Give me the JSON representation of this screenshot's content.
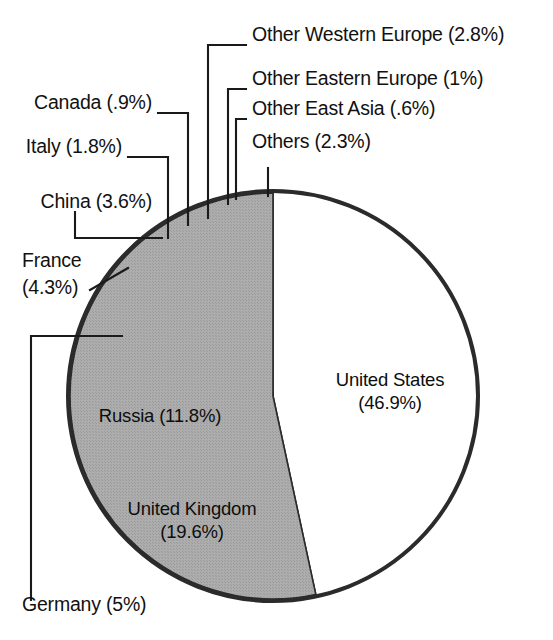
{
  "chart_data": {
    "type": "pie",
    "title": "",
    "subtitle": "",
    "xlabel": "",
    "ylabel": "",
    "legend_position": "none",
    "grid": false,
    "value_unit": "percent",
    "categories": [
      "United States",
      "United Kingdom",
      "Germany",
      "Russia",
      "France",
      "China",
      "Italy",
      "Canada",
      "Other Western Europe",
      "Other Eastern Europe",
      "Other East Asia",
      "Others"
    ],
    "values": [
      46.9,
      19.6,
      5,
      11.8,
      4.3,
      3.6,
      1.8,
      0.9,
      2.8,
      1,
      0.6,
      2.3
    ],
    "slices": [
      {
        "name": "United States",
        "value": 46.9,
        "label": "United States",
        "value_label": "(46.9%)",
        "full_label": "United States (46.9%)",
        "fill": "#a9a9a9",
        "label_placement": "inside"
      },
      {
        "name": "United Kingdom",
        "value": 19.6,
        "label": "United Kingdom",
        "value_label": "(19.6%)",
        "full_label": "United Kingdom (19.6%)",
        "fill": "#b4b4b4",
        "label_placement": "inside"
      },
      {
        "name": "Russia",
        "value": 11.8,
        "label": "Russia (11.8%)",
        "value_label": "(11.8%)",
        "full_label": "Russia (11.8%)",
        "fill": "#6e6e6e",
        "label_placement": "inside"
      },
      {
        "name": "Germany",
        "value": 5,
        "label": "Germany (5%)",
        "value_label": "(5%)",
        "full_label": "Germany (5%)",
        "fill": "#a0a0a0",
        "label_placement": "leader"
      },
      {
        "name": "France",
        "value": 4.3,
        "label": "France",
        "value_label": "(4.3%)",
        "full_label": "France (4.3%)",
        "fill": "#1b1b1b",
        "label_placement": "leader"
      },
      {
        "name": "China",
        "value": 3.6,
        "label": "China (3.6%)",
        "value_label": "(3.6%)",
        "full_label": "China (3.6%)",
        "fill": "#f4f4f4",
        "label_placement": "leader"
      },
      {
        "name": "Italy",
        "value": 1.8,
        "label": "Italy (1.8%)",
        "value_label": "(1.8%)",
        "full_label": "Italy (1.8%)",
        "fill": "#3a3a3a",
        "label_placement": "leader"
      },
      {
        "name": "Canada",
        "value": 0.9,
        "label": "Canada (.9%)",
        "value_label": "(.9%)",
        "full_label": "Canada (.9%)",
        "fill": "#f6f6f6",
        "label_placement": "leader"
      },
      {
        "name": "Other Western Europe",
        "value": 2.8,
        "label": "Other Western Europe (2.8%)",
        "value_label": "(2.8%)",
        "full_label": "Other Western Europe (2.8%)",
        "fill": "#c9c9c9",
        "label_placement": "leader"
      },
      {
        "name": "Other Eastern Europe",
        "value": 1,
        "label": "Other Eastern Europe (1%)",
        "value_label": "(1%)",
        "full_label": "Other Eastern Europe (1%)",
        "fill": "#111111",
        "label_placement": "leader"
      },
      {
        "name": "Other East Asia",
        "value": 0.6,
        "label": "Other East Asia (.6%)",
        "value_label": "(.6%)",
        "full_label": "Other East Asia (.6%)",
        "fill": "#fbfbfb",
        "label_placement": "leader"
      },
      {
        "name": "Others",
        "value": 2.3,
        "label": "Others (2.3%)",
        "value_label": "(2.3%)",
        "full_label": "Others (2.3%)",
        "fill": "#585858",
        "label_placement": "leader"
      }
    ]
  },
  "labels": {
    "other_western_europe": "Other Western Europe (2.8%)",
    "other_eastern_europe": "Other Eastern Europe (1%)",
    "other_east_asia": "Other East Asia (.6%)",
    "others": "Others (2.3%)",
    "canada": "Canada (.9%)",
    "italy": "Italy (1.8%)",
    "china": "China (3.6%)",
    "france_line1": "France",
    "france_line2": "(4.3%)",
    "germany": "Germany (5%)",
    "russia": "Russia (11.8%)",
    "united_kingdom_line1": "United Kingdom",
    "united_kingdom_line2": "(19.6%)",
    "united_states_line1": "United States",
    "united_states_line2": "(46.9%)"
  },
  "style": {
    "background": "#ffffff",
    "text_color": "#111111",
    "outline_color": "#2b2b2b",
    "leader_color": "#1a1a1a"
  }
}
